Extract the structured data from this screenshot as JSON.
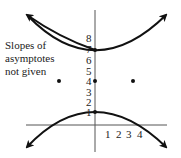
{
  "figure": {
    "type": "hyperbola-graph",
    "note_lines": [
      "Slopes of",
      "asymptotes",
      "not given"
    ],
    "y_ticks": [
      "1",
      "2",
      "3",
      "4",
      "5",
      "6",
      "7",
      "8"
    ],
    "x_ticks": [
      "1",
      "2",
      "3",
      "4"
    ],
    "center": {
      "x": 0,
      "y": 4
    },
    "vertices": [
      {
        "x": 0,
        "y": 7
      },
      {
        "x": 0,
        "y": 1
      }
    ],
    "foci_points": [
      {
        "label": "left point",
        "y": 4
      },
      {
        "label": "right point",
        "y": 4
      }
    ],
    "colors": {
      "curve": "#111111",
      "axis": "#555555",
      "text": "#222222"
    }
  }
}
